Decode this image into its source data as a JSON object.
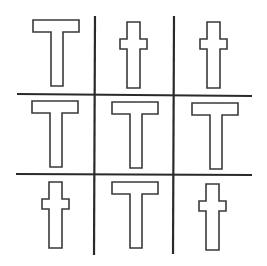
{
  "figure": {
    "type": "3x3 grid puzzle",
    "background": "#ffffff",
    "line_color": "#2a2a2a",
    "shape_stroke": "#3a3a3a",
    "shape_fill": "#ffffff",
    "grid": {
      "vertical_lines_x": [
        95,
        174
      ],
      "horizontal_lines_y": [
        94,
        175
      ]
    },
    "cells": [
      {
        "row": 0,
        "col": 0,
        "shape": "T"
      },
      {
        "row": 0,
        "col": 1,
        "shape": "cross"
      },
      {
        "row": 0,
        "col": 2,
        "shape": "cross"
      },
      {
        "row": 1,
        "col": 0,
        "shape": "T"
      },
      {
        "row": 1,
        "col": 1,
        "shape": "T"
      },
      {
        "row": 1,
        "col": 2,
        "shape": "T"
      },
      {
        "row": 2,
        "col": 0,
        "shape": "cross"
      },
      {
        "row": 2,
        "col": 1,
        "shape": "T"
      },
      {
        "row": 2,
        "col": 2,
        "shape": "cross"
      }
    ]
  }
}
